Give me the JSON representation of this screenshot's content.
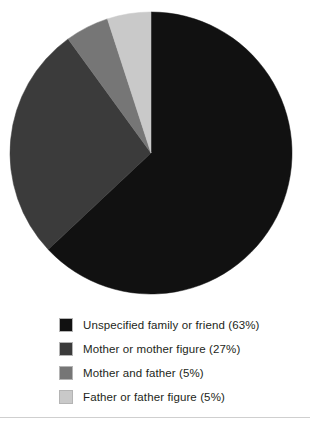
{
  "chart_data": {
    "type": "pie",
    "title": "",
    "subtitle": "",
    "xlabel": "",
    "ylabel": "",
    "legend_position": "bottom",
    "grid": false,
    "start_angle_deg": 0,
    "direction": "clockwise",
    "categories": [
      "Unspecified family or friend",
      "Mother or mother figure",
      "Mother and father",
      "Father or father figure"
    ],
    "values": [
      63,
      27,
      5,
      5
    ],
    "value_unit": "%",
    "colors": [
      "#111111",
      "#3b3b3b",
      "#767676",
      "#c9c9c9"
    ],
    "slices": [
      {
        "label": "Unspecified family or friend",
        "value": 63,
        "display": "Unspecified family or friend (63%)",
        "color": "#111111"
      },
      {
        "label": "Mother or mother figure",
        "value": 27,
        "display": "Mother or mother figure (27%)",
        "color": "#3b3b3b"
      },
      {
        "label": "Mother and father",
        "value": 5,
        "display": "Mother and father (5%)",
        "color": "#767676"
      },
      {
        "label": "Father or father figure",
        "value": 5,
        "display": "Father or father figure (5%)",
        "color": "#c9c9c9"
      }
    ]
  },
  "pie": {
    "center_x": 151,
    "center_y": 153,
    "radius": 141
  },
  "legend": {
    "rows": [
      {
        "label": "Unspecified family or friend (63%)",
        "color": "#111111",
        "top": 4
      },
      {
        "label": "Mother or mother figure (27%)",
        "color": "#3b3b3b",
        "top": 28
      },
      {
        "label": "Mother and father (5%)",
        "color": "#767676",
        "top": 52
      },
      {
        "label": "Father or father figure (5%)",
        "color": "#c9c9c9",
        "top": 76
      }
    ]
  },
  "footer": {
    "rule_color": "#cfcfcf"
  }
}
